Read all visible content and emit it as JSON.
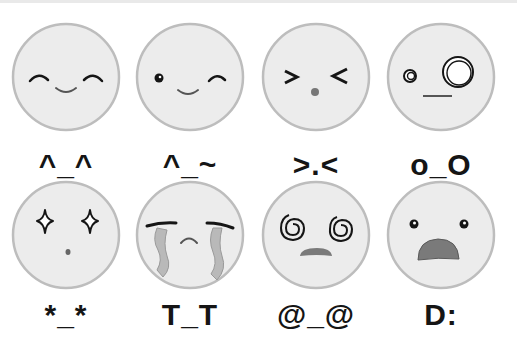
{
  "colors": {
    "face_fill": "#ececec",
    "face_stroke": "#bdbdbd",
    "feature": "#151515",
    "mouth_grey": "#7a7a7a",
    "tear": "#b9b9b9"
  },
  "emoticons": [
    {
      "name": "happy",
      "label": "^_^"
    },
    {
      "name": "wink",
      "label": "^_~"
    },
    {
      "name": "squint",
      "label": ">.<"
    },
    {
      "name": "confused",
      "label": "o_O"
    },
    {
      "name": "starry-eyed",
      "label": "*_*"
    },
    {
      "name": "crying",
      "label": "T_T"
    },
    {
      "name": "dizzy",
      "label": "@_@"
    },
    {
      "name": "shocked",
      "label": "D:"
    }
  ]
}
